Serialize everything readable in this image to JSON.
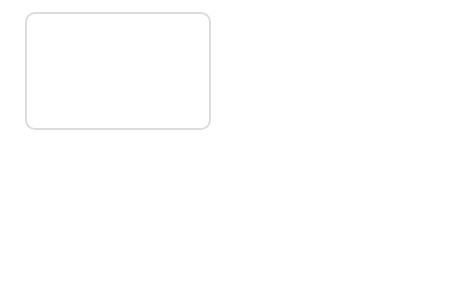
{
  "labels": {
    "frontal": "frontal",
    "optic_canal": "optic canal",
    "superior_orbital_1": "superior orbital",
    "superior_orbital_2": "fissure",
    "sphenoid_left": "sphenoid",
    "parietal": "parietal",
    "sphenoid_right": "sphenoid",
    "temporal": "temporal",
    "ethmoid": "ethmoid",
    "lacrimal": "lacrimal",
    "zygomatic": "zygomatic",
    "maxillary_bones": "maxillary bones",
    "nasal": "nasal",
    "styloid_1": "styloid",
    "styloid_2": "process",
    "mandible": "mandible"
  },
  "colors": {
    "frame": "#dcdcdc",
    "line": "#333333",
    "text": "#222222"
  }
}
